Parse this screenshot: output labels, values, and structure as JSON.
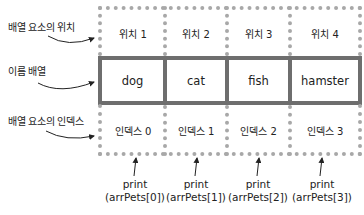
{
  "labels": {
    "position": "배열 요소의 위치",
    "array_name": "이름 배열",
    "index": "배열 요소의 인덱스"
  },
  "positions": [
    "위치 1",
    "위치 2",
    "위치 3",
    "위치 4"
  ],
  "elements": [
    "dog",
    "cat",
    "fish",
    "hamster"
  ],
  "indices": [
    "인덱스 0",
    "인덱스 1",
    "인덱스 2",
    "인덱스 3"
  ],
  "prints": [
    {
      "line1": "print",
      "line2": "(arrPets[0])"
    },
    {
      "line1": "print",
      "line2": "(arrPets[1])"
    },
    {
      "line1": "print",
      "line2": "(arrPets[2])"
    },
    {
      "line1": "print",
      "line2": "(arrPets[3])"
    }
  ],
  "colors": {
    "dotted_border": "#a8a8a8",
    "solid_border": "#6e6e6e",
    "text": "#222222"
  }
}
